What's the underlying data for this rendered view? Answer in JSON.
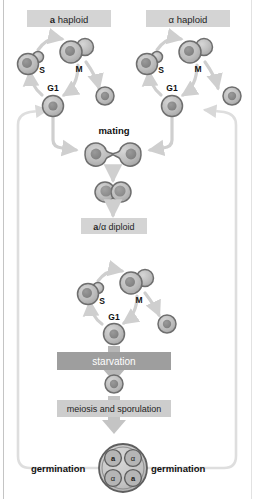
{
  "figure": {
    "background": "#ffffff",
    "frame_rule_color": "#c8c8c8"
  },
  "colors": {
    "band_label_light": "#d2d2d2",
    "band_starvation": "#9e9e9e",
    "band_meiosis": "#c9c9c9",
    "arrow_gray": "#cfcfcf",
    "arrow_thick": "#b4b4b4",
    "cell_fill": "#b9b9b9",
    "cell_stroke": "#6e6e6e",
    "nucleus_fill": "#8c8c8c",
    "text_dark": "#1a1a1a",
    "return_path": "#dcdcdc"
  },
  "banner_labels": {
    "a_haploid": {
      "prefix": "a",
      "suffix": " haploid"
    },
    "alpha_haploid": {
      "prefix": "α",
      "suffix": " haploid"
    },
    "diploid": {
      "prefix": "a",
      "mid": "/α",
      "suffix": " diploid"
    }
  },
  "cycle_labels": {
    "g1": "G1",
    "s": "S",
    "m": "M"
  },
  "process_labels": {
    "mating": "mating",
    "starvation": "starvation",
    "meiosis": "meiosis and sporulation",
    "germination_left": "germination",
    "germination_right": "germination"
  },
  "ascus": {
    "spores": [
      {
        "position": "top-left",
        "label": "a"
      },
      {
        "position": "top-right",
        "label": "α"
      },
      {
        "position": "bottom-left",
        "label": "α"
      },
      {
        "position": "bottom-right",
        "label": "a"
      }
    ]
  },
  "cells": {
    "haploid_a_cycle": [
      "G1",
      "S",
      "M",
      "daughter"
    ],
    "haploid_alpha_cycle": [
      "G1",
      "S",
      "M",
      "daughter"
    ],
    "diploid_cycle": [
      "G1",
      "S",
      "M",
      "daughter"
    ],
    "mating_shmoo_left": "shmoo",
    "mating_shmoo_right": "shmoo",
    "zygote": "zygote",
    "diploid_single": "diploid cell"
  }
}
